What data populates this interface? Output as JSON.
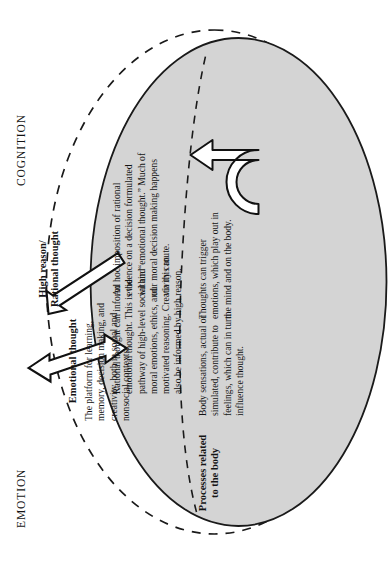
{
  "figure": {
    "axis_labels": {
      "cognition": "COGNITION",
      "emotion": "EMOTION"
    },
    "outer_region_label": "High reason/\nRational thought",
    "blocks": [
      {
        "id": "emotional_thought",
        "heading": "Emotional thought",
        "body": "The platform for learning, memory, decision making, and creativity, both in social and nonsocial contexts."
      },
      {
        "id": "processes_related_to_body",
        "heading": "Processes related\nto the body",
        "body": ""
      },
      {
        "id": "body_sensations",
        "heading": "",
        "body": "Body sensations, actual or simulated, contribute to feelings, which can in turn influence thought."
      },
      {
        "id": "thoughts_trigger_emotions",
        "heading": "",
        "body": "Thoughts can trigger emotions, which play out in the mind and on the body."
      },
      {
        "id": "rational_thought_informs",
        "heading": "",
        "body": "Rational thought can inform emotional thought. This is the pathway of high-level social and moral emotions, ethics, and motivated reasoning. Creativity can also be informed by high reason."
      },
      {
        "id": "ad_hoc_imposition",
        "heading": "",
        "body": "Ad hoc imposition of rational evidence on a decision formulated within “emotional thought.” Much of our moral decision making happens via this route."
      }
    ],
    "shapes": {
      "emotion_ellipse_fill": "#d4d4d4",
      "emotion_ellipse_stroke": "#1a1a1a",
      "cognition_ellipse_stroke": "#1a1a1a",
      "cognition_ellipse_style": "dashed",
      "arrow_fill": "#ffffff",
      "arrow_stroke": "#111111"
    },
    "arrows": [
      {
        "name": "double-headed-arrow",
        "desc": "bidirectional arrow crossing the emotion boundary upward into high reason"
      },
      {
        "name": "single-headed-arrow",
        "desc": "arrow pointing up out of emotional thought into high reason"
      },
      {
        "name": "u-turn-arrow",
        "desc": "curved u-turn arrow looping across the body/emotion boundary"
      }
    ]
  }
}
